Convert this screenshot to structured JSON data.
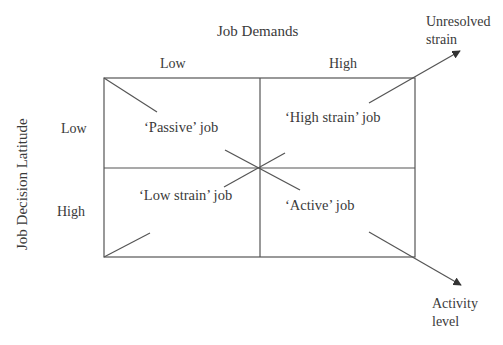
{
  "diagram": {
    "type": "2x2 matrix (Job Demand-Control model)",
    "x_axis": {
      "title": "Job Demands",
      "levels": [
        "Low",
        "High"
      ]
    },
    "y_axis": {
      "title": "Job Decision Latitude",
      "levels": [
        "Low",
        "High"
      ]
    },
    "quadrants": {
      "low_demand_low_latitude": "‘Passive’ job",
      "high_demand_low_latitude": "‘High strain’ job",
      "low_demand_high_latitude": "‘Low strain’ job",
      "high_demand_high_latitude": "‘Active’ job"
    },
    "arrows": {
      "strain": {
        "line1": "Unresolved",
        "line2": "strain"
      },
      "activity": {
        "line1": "Activity",
        "line2": "level"
      }
    },
    "colors": {
      "line": "#555555",
      "text": "#3a3a3a",
      "background": "#ffffff"
    }
  }
}
